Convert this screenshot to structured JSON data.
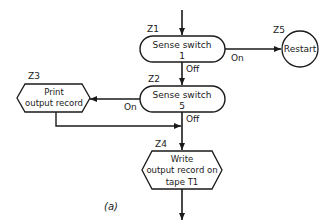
{
  "diagram": {
    "caption": "(a)",
    "nodes": {
      "z1": {
        "id": "Z1",
        "type": "decision-capsule",
        "line1": "Sense switch",
        "line2": "1"
      },
      "z2": {
        "id": "Z2",
        "type": "decision-capsule",
        "line1": "Sense switch",
        "line2": "5"
      },
      "z3": {
        "id": "Z3",
        "type": "io-hexagon",
        "line1": "Print",
        "line2": "output record"
      },
      "z4": {
        "id": "Z4",
        "type": "io-hexagon",
        "line1": "Write",
        "line2": "output record on",
        "line3": "tape T1"
      },
      "z5": {
        "id": "Z5",
        "type": "connector-circle",
        "line1": "Restart"
      }
    },
    "edges": {
      "z1_on": {
        "from": "Z1",
        "to": "Z5",
        "label": "On"
      },
      "z1_off": {
        "from": "Z1",
        "to": "Z2",
        "label": "Off"
      },
      "z2_on": {
        "from": "Z2",
        "to": "Z3",
        "label": "On"
      },
      "z2_off": {
        "from": "Z2",
        "to": "Z4",
        "label": "Off"
      },
      "z3_out": {
        "from": "Z3",
        "to": "Z4",
        "label": ""
      }
    },
    "colors": {
      "stroke": "#1a1a1a",
      "background": "#ffffff"
    }
  }
}
